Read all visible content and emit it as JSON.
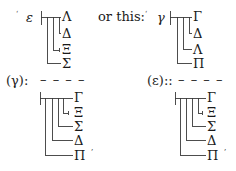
{
  "connector_text": "or this:",
  "tree1": {
    "quote": "‘",
    "root": "ε",
    "leaves": [
      "Λ",
      "Δ",
      "Ξ",
      "Σ"
    ]
  },
  "tree2": {
    "quote": "‘",
    "root": "γ",
    "leaves": [
      "Γ",
      "Δ",
      "Λ",
      "Π"
    ]
  },
  "label3": {
    "text": "(γ):",
    "dashes": "– – – –"
  },
  "tree3": {
    "leaves": [
      "Γ",
      "Ξ",
      "Σ",
      "Δ",
      "Π"
    ],
    "close_quote": "’"
  },
  "label4": {
    "text": "(ε)::",
    "dashes": "– – – –"
  },
  "tree4": {
    "leaves": [
      "Γ",
      "Ξ",
      "Σ",
      "Δ",
      "Π"
    ],
    "close_quote": "’"
  }
}
